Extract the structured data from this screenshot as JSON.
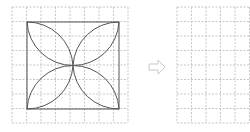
{
  "diagram": {
    "left_grid": {
      "x": 12,
      "y": 7,
      "cell": 14.5,
      "cols": 8,
      "rows": 8
    },
    "right_grid": {
      "x": 177,
      "y": 7,
      "cell": 14.5,
      "cols": 6,
      "rows": 8
    },
    "arrow": {
      "glyph": "hollow-right-arrow"
    },
    "colors": {
      "grid": "#b8b8b8",
      "figure": "#555555",
      "arrow": "#c8c8c8"
    }
  }
}
